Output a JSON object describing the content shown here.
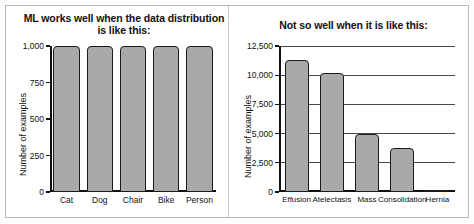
{
  "figure": {
    "panels": [
      {
        "title": "ML works well when the data distribution is like this:",
        "ylabel": "Number of examples"
      },
      {
        "title": "Not so well when it is like this:",
        "ylabel": "Number of examples"
      }
    ]
  },
  "chart_data": [
    {
      "type": "bar",
      "title": "ML works well when the data distribution is like this:",
      "xlabel": "",
      "ylabel": "Number of examples",
      "categories": [
        "Cat",
        "Dog",
        "Chair",
        "Bike",
        "Person"
      ],
      "values": [
        1000,
        1000,
        1000,
        1000,
        1000
      ],
      "ylim": [
        0,
        1000
      ],
      "yticks": [
        0,
        250,
        500,
        750,
        1000
      ],
      "ytick_labels": [
        "0",
        "250",
        "500",
        "750",
        "1,000"
      ],
      "grid": false,
      "legend": "none",
      "bar_color": "#a9a9a9",
      "bar_edge_color": "#1b1b1b"
    },
    {
      "type": "bar",
      "title": "Not so well when it is like this:",
      "xlabel": "",
      "ylabel": "Number of examples",
      "categories": [
        "Effusion",
        "Atelectasis",
        "Mass",
        "Consolidation",
        "Hernia"
      ],
      "values": [
        11300,
        10200,
        5000,
        3800,
        150
      ],
      "ylim": [
        0,
        12500
      ],
      "yticks": [
        0,
        2500,
        5000,
        7500,
        10000,
        12500
      ],
      "ytick_labels": [
        "0",
        "2,500",
        "5,000",
        "7,500",
        "10,000",
        "12,500"
      ],
      "grid": true,
      "legend": "none",
      "bar_color": "#a9a9a9",
      "bar_edge_color": "#1b1b1b"
    }
  ]
}
